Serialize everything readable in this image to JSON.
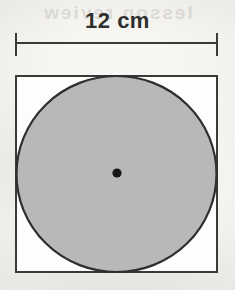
{
  "figure": {
    "type": "geometry-diagram",
    "dimension_label": "12 cm",
    "center_marker": "center-point-dot",
    "colors": {
      "background": "#f6f5f2",
      "square_fill": "#fdfdfb",
      "square_stroke": "#3a3a3a",
      "circle_fill": "#b8b8b8",
      "circle_stroke": "#2e2e2e",
      "center_dot": "#181818",
      "label_text": "#2f2f2f",
      "dimension_line": "#3a3a3a"
    },
    "bleed_through_artifact": "lesson review",
    "shapes": {
      "square": {
        "name": "square",
        "side_label": "12 cm",
        "x": 16,
        "y": 76,
        "width": 201,
        "height": 196,
        "stroke_width": 2
      },
      "circle": {
        "name": "inscribed-circle",
        "cx": 116.5,
        "cy": 174,
        "rx": 100,
        "ry": 98,
        "stroke_width": 2.2,
        "diameter_label": "12 cm"
      },
      "center_dot": {
        "name": "center-dot",
        "cx": 117,
        "cy": 173,
        "r": 4.6
      }
    },
    "dimension": {
      "name": "width-dimension",
      "label": "12 cm",
      "line_y": 43,
      "x_start": 16,
      "x_end": 217,
      "tick_top": 33,
      "tick_bottom": 56,
      "stroke_width": 2
    }
  }
}
